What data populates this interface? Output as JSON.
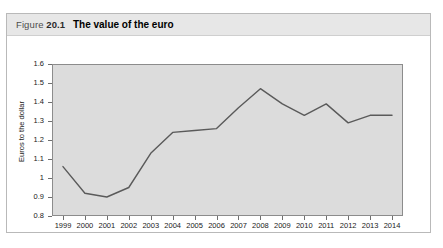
{
  "figure": {
    "number_prefix": "Figure",
    "number": "20.1",
    "title": "The value of the euro"
  },
  "chart_data": {
    "type": "line",
    "title": "The value of the euro",
    "xlabel": "",
    "ylabel": "Euros to the dollar",
    "x": [
      1999,
      2000,
      2001,
      2002,
      2003,
      2004,
      2005,
      2006,
      2007,
      2008,
      2009,
      2010,
      2011,
      2012,
      2013,
      2014
    ],
    "categories": [
      "1999",
      "2000",
      "2001",
      "2002",
      "2003",
      "2004",
      "2005",
      "2006",
      "2007",
      "2008",
      "2009",
      "2010",
      "2011",
      "2012",
      "2013",
      "2014"
    ],
    "values": [
      1.06,
      0.92,
      0.9,
      0.95,
      1.13,
      1.24,
      1.25,
      1.26,
      1.37,
      1.47,
      1.39,
      1.33,
      1.39,
      1.29,
      1.33,
      1.33
    ],
    "ylim": [
      0.8,
      1.6
    ],
    "ytick_labels": [
      "1.6",
      "1.5",
      "1.4",
      "1.3",
      "1.2",
      "1.1",
      "1",
      "0.9",
      "0.8"
    ],
    "ytick_values": [
      1.6,
      1.5,
      1.4,
      1.3,
      1.2,
      1.1,
      1.0,
      0.9,
      0.8
    ],
    "grid": false,
    "legend": null,
    "series_color": "#5a5a5a",
    "plot_background": "#dcdcdc",
    "frame_color": "#8c8c8c"
  }
}
